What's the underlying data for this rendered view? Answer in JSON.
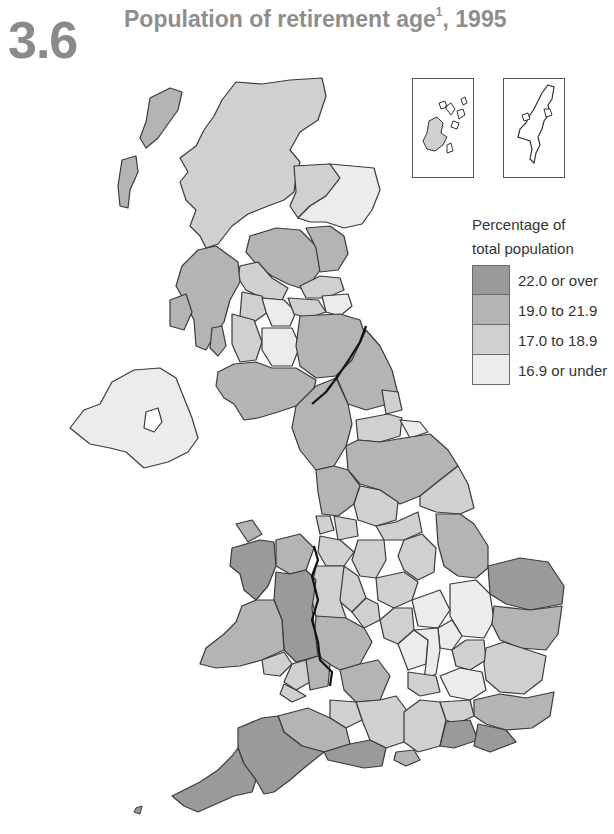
{
  "figure": {
    "number": "3.6",
    "title": "Population of retirement age",
    "title_footnote": "1",
    "title_suffix": ", 1995"
  },
  "legend": {
    "title_line1": "Percentage of",
    "title_line2": "total population",
    "items": [
      {
        "label": "22.0 or over",
        "color": "#9a9a9a"
      },
      {
        "label": "19.0 to 21.9",
        "color": "#b4b4b4"
      },
      {
        "label": "17.0 to 18.9",
        "color": "#d0d0d0"
      },
      {
        "label": "16.9 or under",
        "color": "#ececec"
      }
    ]
  },
  "insets": [
    {
      "name": "Orkney"
    },
    {
      "name": "Shetland"
    }
  ],
  "map": {
    "stroke": "#3a3a3a",
    "national_border_stroke": "#111111"
  }
}
